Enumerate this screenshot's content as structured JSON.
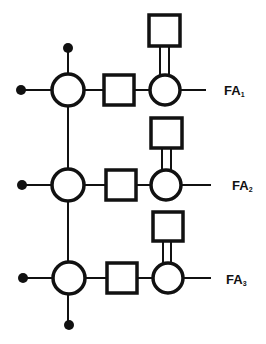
{
  "diagram": {
    "type": "schematic",
    "rows": [
      {
        "label": "FA",
        "subscript": "1",
        "y": 90
      },
      {
        "label": "FA",
        "subscript": "2",
        "y": 185
      },
      {
        "label": "FA",
        "subscript": "3",
        "y": 278
      }
    ],
    "colors": {
      "stroke": "#111111",
      "background": "#ffffff"
    }
  }
}
